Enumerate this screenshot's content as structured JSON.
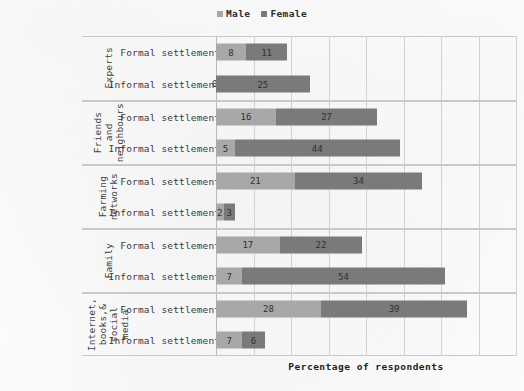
{
  "legend": {
    "items": [
      {
        "label": "Male",
        "color": "#a8a8a8",
        "icon": "legend-square-icon"
      },
      {
        "label": "Female",
        "color": "#7a7a7a",
        "icon": "legend-square-icon"
      }
    ]
  },
  "axis": {
    "xlabel": "Percentage of respondents"
  },
  "chart_data": {
    "type": "bar",
    "orientation": "horizontal",
    "stacked": true,
    "title": "",
    "subtitle": "",
    "xlabel": "Percentage of respondents",
    "ylabel": "",
    "xlim": [
      0,
      80
    ],
    "xtick_labels": [],
    "grid": true,
    "grid_axis": "x",
    "grid_interval": 10,
    "legend_position": "top-center",
    "legend_entries": [
      "Male",
      "Female"
    ],
    "series": [
      {
        "name": "Male",
        "color": "#a8a8a8"
      },
      {
        "name": "Female",
        "color": "#7a7a7a"
      }
    ],
    "groups": [
      {
        "label": "Experts",
        "label_lines": [
          "Experts"
        ],
        "rows": [
          {
            "category": "Formal settlements",
            "values": [
              8,
              11
            ],
            "labels": [
              "8",
              "11"
            ]
          },
          {
            "category": "Informal settlements",
            "values": [
              0,
              25
            ],
            "labels": [
              "0",
              "25"
            ]
          }
        ]
      },
      {
        "label": "Friends and neighbours",
        "label_lines": [
          "Friends",
          "and",
          "neighbours"
        ],
        "rows": [
          {
            "category": "Formal settlements",
            "values": [
              16,
              27
            ],
            "labels": [
              "16",
              "27"
            ]
          },
          {
            "category": "Informal settlements",
            "values": [
              5,
              44
            ],
            "labels": [
              "5",
              "44"
            ]
          }
        ]
      },
      {
        "label": "Farming networks",
        "label_lines": [
          "Farming",
          "networks"
        ],
        "rows": [
          {
            "category": "Formal settlements",
            "values": [
              21,
              34
            ],
            "labels": [
              "21",
              "34"
            ]
          },
          {
            "category": "Informal settlements",
            "values": [
              2,
              3
            ],
            "labels": [
              "2",
              "3"
            ]
          }
        ]
      },
      {
        "label": "Family",
        "label_lines": [
          "Family"
        ],
        "rows": [
          {
            "category": "Formal settlements",
            "values": [
              17,
              22
            ],
            "labels": [
              "17",
              "22"
            ]
          },
          {
            "category": "Informal settlements",
            "values": [
              7,
              54
            ],
            "labels": [
              "7",
              "54"
            ]
          }
        ]
      },
      {
        "label": "Internet, books,& social media",
        "label_lines": [
          "Internet,",
          "books,&",
          "social",
          "media"
        ],
        "rows": [
          {
            "category": "Formal settlements",
            "values": [
              28,
              39
            ],
            "labels": [
              "28",
              "39"
            ]
          },
          {
            "category": "Informal settlements",
            "values": [
              7,
              6
            ],
            "labels": [
              "7",
              "6"
            ]
          }
        ]
      }
    ]
  }
}
